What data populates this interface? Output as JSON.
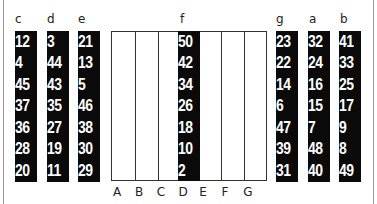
{
  "left_columns": [
    {
      "label": "c",
      "values": [
        "12",
        "4",
        "45",
        "37",
        "36",
        "28",
        "20"
      ]
    },
    {
      "label": "d",
      "values": [
        "3",
        "44",
        "43",
        "35",
        "27",
        "19",
        "11"
      ]
    },
    {
      "label": "e",
      "values": [
        "21",
        "13",
        "5",
        "46",
        "38",
        "30",
        "29"
      ]
    }
  ],
  "center": {
    "label": "f",
    "highlighted_column": "D",
    "values": [
      "50",
      "42",
      "34",
      "26",
      "18",
      "10",
      "2"
    ],
    "bottom_labels": [
      "A",
      "B",
      "C",
      "D",
      "E",
      "F",
      "G"
    ]
  },
  "right_columns": [
    {
      "label": "g",
      "values": [
        "23",
        "22",
        "14",
        "6",
        "47",
        "39",
        "31"
      ]
    },
    {
      "label": "a",
      "values": [
        "32",
        "24",
        "16",
        "15",
        "7",
        "48",
        "40"
      ]
    },
    {
      "label": "b",
      "values": [
        "41",
        "33",
        "25",
        "17",
        "9",
        "8",
        "49"
      ]
    }
  ],
  "colors": {
    "strip": "#0a0a0a",
    "text_on_strip": "#ffffff",
    "grid_line": "#333333"
  }
}
